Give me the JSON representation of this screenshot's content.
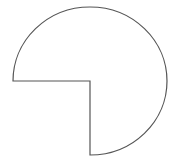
{
  "diagram": {
    "shape": "three-quarter-circle",
    "missing_quadrant": "lower-left",
    "center": [
      90,
      81
    ],
    "radius_x": 77,
    "radius_y": 74,
    "stroke_color": "#555555",
    "fill_color": "#ffffff"
  }
}
